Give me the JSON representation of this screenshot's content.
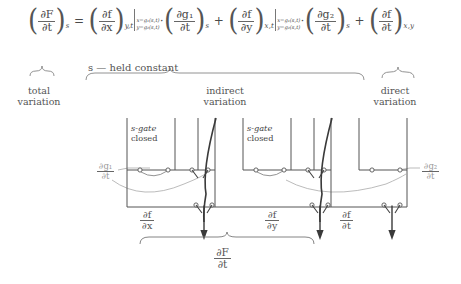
{
  "figure": {
    "kind": "chain-rule-circuit-analogy",
    "equation": {
      "lhs": {
        "frac_num": "∂F",
        "frac_den": "∂t",
        "subscript": "s"
      },
      "equals": "=",
      "terms": [
        {
          "id": "term-1",
          "partial": {
            "frac_num": "∂f",
            "frac_den": "∂x",
            "subscript": "y,t"
          },
          "evaluated_at": [
            "x=g₁(s,t)",
            "y=g₂(s,t)"
          ],
          "dot": "·",
          "factor": {
            "frac_num": "∂g₁",
            "frac_den": "∂t",
            "subscript": "s"
          },
          "plus": "+"
        },
        {
          "id": "term-2",
          "partial": {
            "frac_num": "∂f",
            "frac_den": "∂y",
            "subscript": "x,t"
          },
          "evaluated_at": [
            "x=g₁(s,t)",
            "y=g₂(s,t)"
          ],
          "dot": "·",
          "factor": {
            "frac_num": "∂g₂",
            "frac_den": "∂t",
            "subscript": "s"
          },
          "plus": "+"
        },
        {
          "id": "term-3",
          "partial": {
            "frac_num": "∂f",
            "frac_den": "∂t",
            "subscript": "x,y"
          },
          "evaluated_at": [],
          "dot": "",
          "factor": null,
          "plus": ""
        }
      ]
    },
    "held_constant_note": "s — held constant",
    "brace_labels": [
      {
        "id": "total",
        "line1": "total",
        "line2": "variation"
      },
      {
        "id": "indirect",
        "line1": "indirect",
        "line2": "variation"
      },
      {
        "id": "direct",
        "line1": "direct",
        "line2": "variation"
      }
    ],
    "circuit": {
      "gate_boxes": [
        {
          "id": "s-gate-1",
          "line1": "s-gate",
          "line2": "closed"
        },
        {
          "id": "s-gate-2",
          "line1": "s-gate",
          "line2": "closed"
        }
      ],
      "input_labels": [
        {
          "id": "dg1-dt",
          "num": "∂g₁",
          "den": "∂t",
          "side": "left"
        },
        {
          "id": "dg2-dt",
          "num": "∂g₂",
          "den": "∂t",
          "side": "right"
        }
      ],
      "output_labels": [
        {
          "id": "df-dx",
          "num": "∂f",
          "den": "∂x"
        },
        {
          "id": "df-dy",
          "num": "∂f",
          "den": "∂y"
        },
        {
          "id": "df-dt",
          "num": "∂f",
          "den": "∂t"
        }
      ],
      "result_label": {
        "id": "dF-dt",
        "num": "∂F",
        "den": "∂t"
      }
    },
    "colors": {
      "ink": "#555555",
      "rule": "#666666",
      "gray_wire": "#aaaaaa",
      "background": "#ffffff"
    }
  }
}
